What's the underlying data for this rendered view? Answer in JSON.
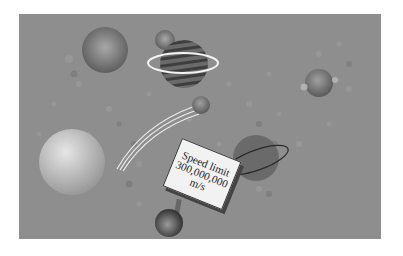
{
  "illustration": {
    "description": "Planets in space with a speed limit road sign",
    "background_color": "#8e8e8e",
    "sign": {
      "line1": "Speed limit",
      "line2": "300,000,000",
      "line3": "m/s"
    },
    "objects": [
      {
        "name": "large-planet-top-left",
        "type": "planet"
      },
      {
        "name": "small-moon",
        "type": "moon"
      },
      {
        "name": "striped-ringed-planet",
        "type": "planet",
        "ring": "white"
      },
      {
        "name": "small-planet-right",
        "type": "planet"
      },
      {
        "name": "comet",
        "type": "comet"
      },
      {
        "name": "large-pale-planet-left",
        "type": "planet"
      },
      {
        "name": "dark-ringed-planet",
        "type": "planet",
        "ring": "dark"
      },
      {
        "name": "sign-ball-base",
        "type": "sphere"
      }
    ]
  }
}
